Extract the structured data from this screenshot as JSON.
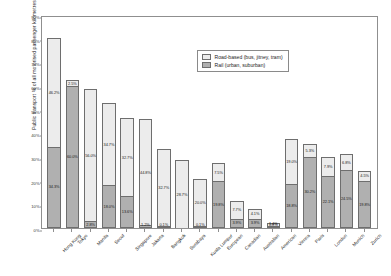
{
  "chart_data": {
    "type": "bar",
    "stacked": true,
    "title": "",
    "xlabel": "",
    "ylabel": "Public transport % of all motorised passenger kilometres",
    "ylim": [
      0,
      90
    ],
    "ytick_labels": [
      "0%",
      "10%",
      "20%",
      "30%",
      "40%",
      "50%",
      "60%",
      "70%",
      "80%",
      "90%"
    ],
    "ytick_values": [
      0,
      10,
      20,
      30,
      40,
      50,
      60,
      70,
      80,
      90
    ],
    "grid": false,
    "legend_position": "top-right",
    "categories": [
      "Hong Kong",
      "Tokyo",
      "Manila",
      "Seoul",
      "Singapore",
      "Jakarta",
      "Bangkok",
      "Surabaya",
      "Kuala Lumpur",
      "European",
      "Canadian",
      "Australian",
      "American",
      "Vienna",
      "Paris",
      "London",
      "Munich",
      "Zurich"
    ],
    "series": [
      {
        "name": "Rail (urban, suburban)",
        "color": "#b0b0b0",
        "values": [
          34.3,
          60.0,
          2.8,
          18.0,
          13.6,
          1.2,
          0.1,
          0.0,
          0.1,
          19.8,
          3.9,
          3.9,
          0.8,
          18.8,
          30.2,
          22.1,
          24.5,
          19.8
        ],
        "labels": [
          "34.3%",
          "60.0%",
          "2.8%",
          "18.0%",
          "13.6%",
          "1.2%",
          "0.1%",
          "",
          "0.1%",
          "19.8%",
          "3.9%",
          "3.9%",
          "0.8%",
          "18.8%",
          "30.2%",
          "22.1%",
          "24.5%",
          "19.8%"
        ]
      },
      {
        "name": "Road-based (bus, jitney, tram)",
        "color": "#ececec",
        "values": [
          46.2,
          2.5,
          56.0,
          34.7,
          32.7,
          44.8,
          32.7,
          28.7,
          20.0,
          7.5,
          7.7,
          4.1,
          1.4,
          19.0,
          5.3,
          7.9,
          6.8,
          4.5
        ],
        "labels": [
          "46.2%",
          "2.5%",
          "56.0%",
          "34.7%",
          "32.7%",
          "44.8%",
          "32.7%",
          "28.7%",
          "20.0%",
          "7.5%",
          "7.7%",
          "4.1%",
          "1.4%",
          "19.0%",
          "5.3%",
          "7.9%",
          "6.8%",
          "4.5%"
        ]
      }
    ]
  },
  "legend": {
    "items": [
      {
        "label": "Road-based (bus, jitney, tram)",
        "swatch": "road"
      },
      {
        "label": "Rail (urban, suburban)",
        "swatch": "rail"
      }
    ]
  }
}
